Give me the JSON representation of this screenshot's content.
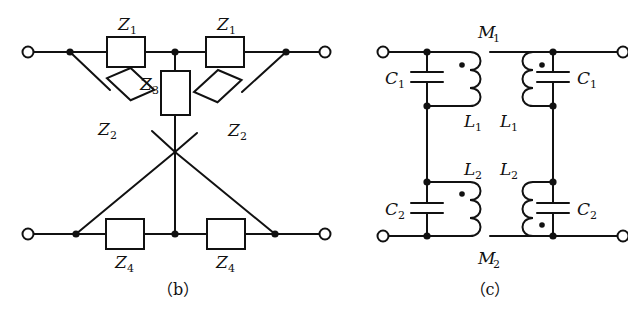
{
  "figure": {
    "stroke_color": "#111111",
    "background_color": "#ffffff"
  },
  "panel_b": {
    "caption": "（b）",
    "type": "lattice-bridge-network",
    "labels": {
      "z1_left": "Z",
      "z1_left_sub": "1",
      "z1_right": "Z",
      "z1_right_sub": "1",
      "z2_left": "Z",
      "z2_left_sub": "2",
      "z2_right": "Z",
      "z2_right_sub": "2",
      "z3": "Z",
      "z3_sub": "3",
      "z4_left": "Z",
      "z4_left_sub": "4",
      "z4_right": "Z",
      "z4_right_sub": "4"
    },
    "terminals": [
      "top-left",
      "top-right",
      "bottom-left",
      "bottom-right"
    ]
  },
  "panel_c": {
    "caption": "（c）",
    "type": "coupled-inductor-capacitor-network",
    "labels": {
      "c1_left": "C",
      "c1_left_sub": "1",
      "c1_right": "C",
      "c1_right_sub": "1",
      "c2_left": "C",
      "c2_left_sub": "2",
      "c2_right": "C",
      "c2_right_sub": "2",
      "l1_left": "L",
      "l1_left_sub": "1",
      "l1_right": "L",
      "l1_right_sub": "1",
      "l2_left": "L",
      "l2_left_sub": "2",
      "l2_right": "L",
      "l2_right_sub": "2",
      "m1": "M",
      "m1_sub": "1",
      "m2": "M",
      "m2_sub": "2"
    },
    "terminals": [
      "top-left",
      "top-right",
      "bottom-left",
      "bottom-right"
    ],
    "dot_convention_marks": 4
  }
}
